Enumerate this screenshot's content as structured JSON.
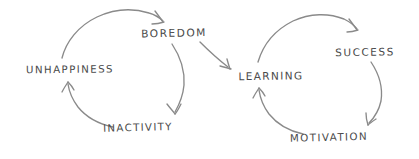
{
  "diagram": {
    "background_color": "#ffffff",
    "stroke_color": "#8a8a8a",
    "text_color": "#4a4a4a",
    "style": "hand-drawn sketch",
    "cycles": [
      {
        "name": "vicious-cycle",
        "nodes": [
          {
            "id": "unhappiness",
            "label": "UNHAPPINESS"
          },
          {
            "id": "boredom",
            "label": "BOREDOM"
          },
          {
            "id": "inactivity",
            "label": "INACTIVITY"
          }
        ],
        "edges": [
          {
            "from": "unhappiness",
            "to": "boredom"
          },
          {
            "from": "boredom",
            "to": "inactivity"
          },
          {
            "from": "inactivity",
            "to": "unhappiness"
          }
        ]
      },
      {
        "name": "virtuous-cycle",
        "nodes": [
          {
            "id": "learning",
            "label": "LEARNING"
          },
          {
            "id": "success",
            "label": "SUCCESS"
          },
          {
            "id": "motivation",
            "label": "MOTIVATION"
          }
        ],
        "edges": [
          {
            "from": "learning",
            "to": "success"
          },
          {
            "from": "success",
            "to": "motivation"
          },
          {
            "from": "motivation",
            "to": "learning"
          }
        ]
      }
    ],
    "connectors": [
      {
        "from": "boredom",
        "to": "learning",
        "name": "boredom-to-learning-arrow"
      }
    ]
  }
}
